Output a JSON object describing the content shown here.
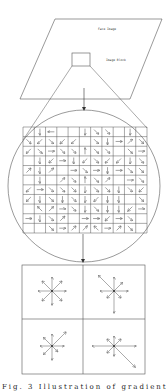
{
  "labels": {
    "face_image": "Face Image",
    "image_block": "Image Block"
  },
  "caption": "Fig. 3  Illustration of gradient orientation histogram from image blocks",
  "colors": {
    "stroke": "#555555",
    "background": "#ffffff"
  },
  "grid": {
    "rows": 11,
    "cols": 11,
    "arrows": [
      [
        "",
        "↓",
        "←",
        "",
        "",
        "↓",
        "↘",
        "↘",
        "",
        "↓",
        ""
      ],
      [
        "↘",
        "↙",
        "↘",
        "↙",
        "↙",
        "",
        "↘",
        "↓",
        "→",
        "↗",
        "↘"
      ],
      [
        "↙",
        "↘",
        "→",
        "↘",
        "↘",
        "↑",
        "↘",
        "↘",
        "",
        "↘",
        "→"
      ],
      [
        "",
        "↓",
        "↙",
        "→",
        "↓",
        "↙",
        "↘",
        "↙",
        "↙",
        "↓",
        "↘"
      ],
      [
        "↗",
        "↓",
        "↗",
        "",
        "→",
        "↘",
        "→",
        "↓",
        "→",
        "↘",
        "↘"
      ],
      [
        "",
        "↓",
        "",
        "↗",
        "↘",
        "↑",
        "↘",
        "↗",
        "",
        "→",
        "↘"
      ],
      [
        "↙",
        "→",
        "↘",
        "↘",
        "↘",
        "↓",
        "↘",
        "↘",
        "↓",
        "↘",
        "↙"
      ],
      [
        "↙",
        "↓",
        "↘",
        "↓",
        "↘",
        "↓",
        "↙",
        "↓",
        "↓",
        "",
        "↘"
      ],
      [
        "",
        "↖",
        "↗",
        "→",
        "↘",
        "↓",
        "↘",
        "↓",
        "↓",
        "↙",
        "→"
      ],
      [
        "→",
        "↓",
        "↘",
        "↗",
        "",
        "→",
        "→",
        "↙",
        "→",
        "↘",
        ""
      ],
      [
        "",
        "",
        "↘",
        "→",
        "↗",
        "↗",
        "↖",
        "→",
        "↗",
        "↘",
        ""
      ]
    ]
  },
  "histograms": [
    {
      "id": "top-left",
      "bins": [
        14,
        14,
        14,
        14,
        14,
        14,
        14,
        14
      ]
    },
    {
      "id": "top-right",
      "bins": [
        14,
        12,
        14,
        22,
        14,
        10,
        22,
        10
      ]
    },
    {
      "id": "bottom-left",
      "bins": [
        12,
        20,
        12,
        12,
        12,
        12,
        14,
        8
      ]
    },
    {
      "id": "bottom-right",
      "bins": [
        22,
        10,
        10,
        10,
        22,
        10,
        10,
        30
      ]
    }
  ]
}
